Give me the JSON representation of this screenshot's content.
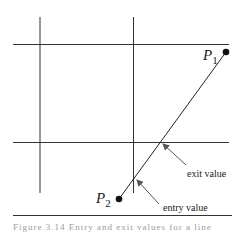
{
  "diagram": {
    "points": [
      {
        "label": "P",
        "subscript": "1",
        "x": 226,
        "y": 52
      },
      {
        "label": "P",
        "subscript": "2",
        "x": 119,
        "y": 199
      }
    ],
    "annotations": {
      "exit": "exit value",
      "entry": "entry value"
    },
    "colors": {
      "line": "#222222",
      "arrow": "#555555"
    }
  },
  "caption": "Figure 3.14    Entry and exit values for a line"
}
